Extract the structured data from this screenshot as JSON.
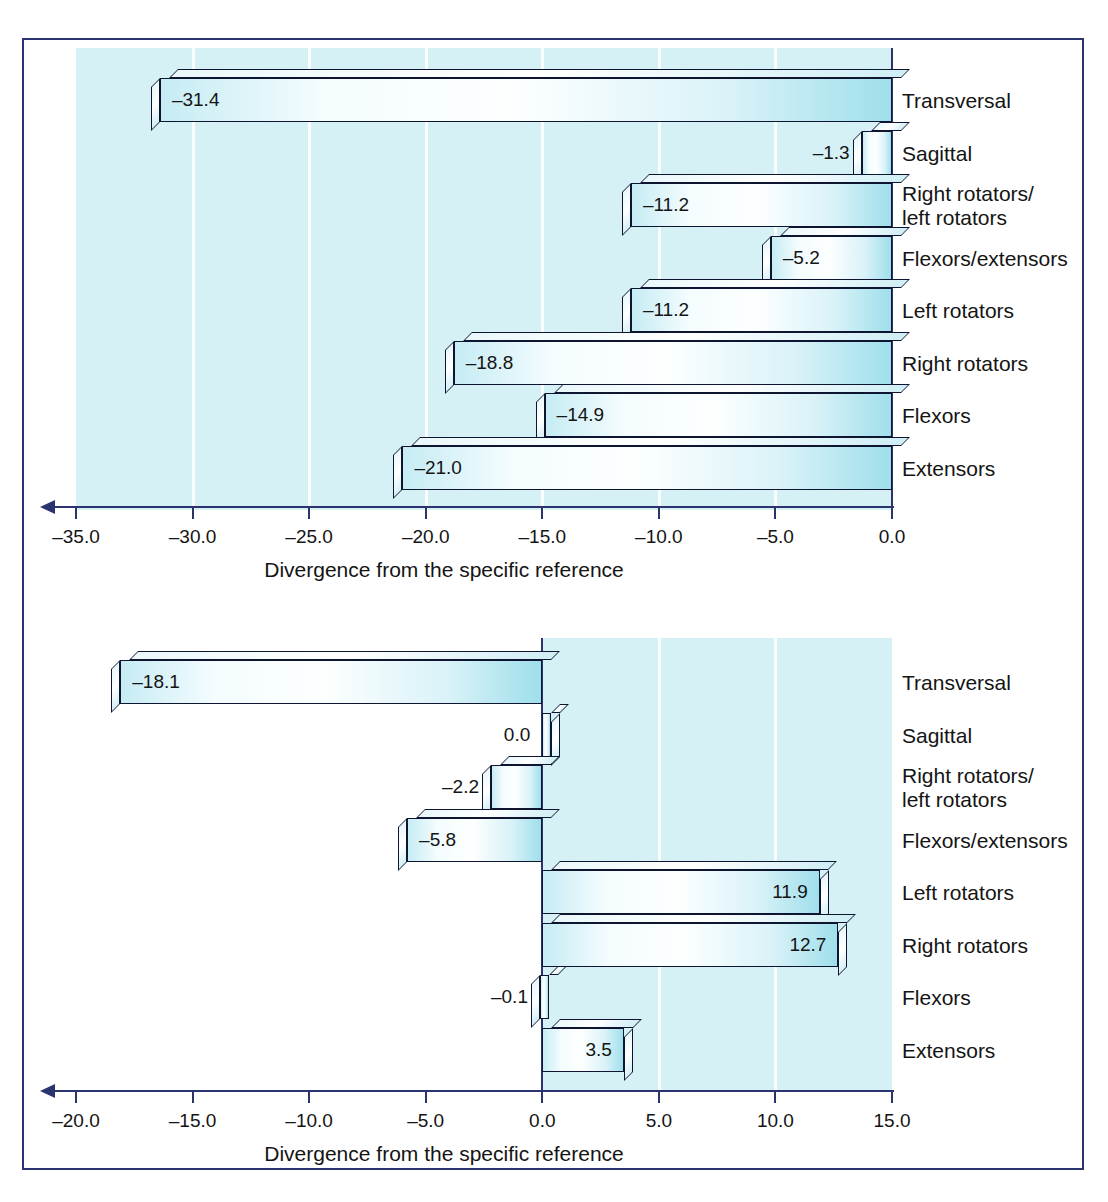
{
  "figure": {
    "frame_color": "#2c3470",
    "plot_bg_color": "#d6f1f6",
    "bar_accent_color": "#9fdfeb",
    "bar_outline_color": "#0d1530"
  },
  "chart_data": [
    {
      "id": "top",
      "type": "bar",
      "orientation": "horizontal",
      "title": "",
      "xlabel": "Divergence from the specific reference",
      "ylabel": "",
      "xlim": [
        -35.0,
        0.0
      ],
      "xticks": [
        "-35.0",
        "-30.0",
        "-25.0",
        "-20.0",
        "-15.0",
        "-10.0",
        "-5.0",
        "0.0"
      ],
      "xtick_values": [
        -35,
        -30,
        -25,
        -20,
        -15,
        -10,
        -5,
        0
      ],
      "grid": true,
      "legend": "none",
      "categories": [
        "Transversal",
        "Sagittal",
        "Right rotators/\nleft rotators",
        "Flexors/extensors",
        "Left rotators",
        "Right rotators",
        "Flexors",
        "Extensors"
      ],
      "values": [
        -31.4,
        -1.3,
        -11.2,
        -5.2,
        -11.2,
        -18.8,
        -14.9,
        -21.0
      ],
      "value_labels": [
        "–31.4",
        "–1.3",
        "–11.2",
        "–5.2",
        "–11.2",
        "–18.8",
        "–14.9",
        "–21.0"
      ],
      "label_inside": [
        true,
        false,
        true,
        true,
        true,
        true,
        true,
        true
      ]
    },
    {
      "id": "bottom",
      "type": "bar",
      "orientation": "horizontal",
      "title": "",
      "xlabel": "Divergence from the specific reference",
      "ylabel": "",
      "xlim": [
        -20.0,
        15.0
      ],
      "xticks": [
        "-20.0",
        "-15.0",
        "-10.0",
        "-5.0",
        "0.0",
        "5.0",
        "10.0",
        "15.0"
      ],
      "xtick_values": [
        -20,
        -15,
        -10,
        -5,
        0,
        5,
        10,
        15
      ],
      "grid": true,
      "legend": "none",
      "categories": [
        "Transversal",
        "Sagittal",
        "Right rotators/\nleft rotators",
        "Flexors/extensors",
        "Left rotators",
        "Right rotators",
        "Flexors",
        "Extensors"
      ],
      "values": [
        -18.1,
        0.0,
        -2.2,
        -5.8,
        11.9,
        12.7,
        -0.1,
        3.5
      ],
      "value_labels": [
        "–18.1",
        "0.0",
        "–2.2",
        "–5.8",
        "11.9",
        "12.7",
        "–0.1",
        "3.5"
      ],
      "label_inside": [
        true,
        false,
        false,
        true,
        true,
        true,
        false,
        true
      ]
    }
  ]
}
